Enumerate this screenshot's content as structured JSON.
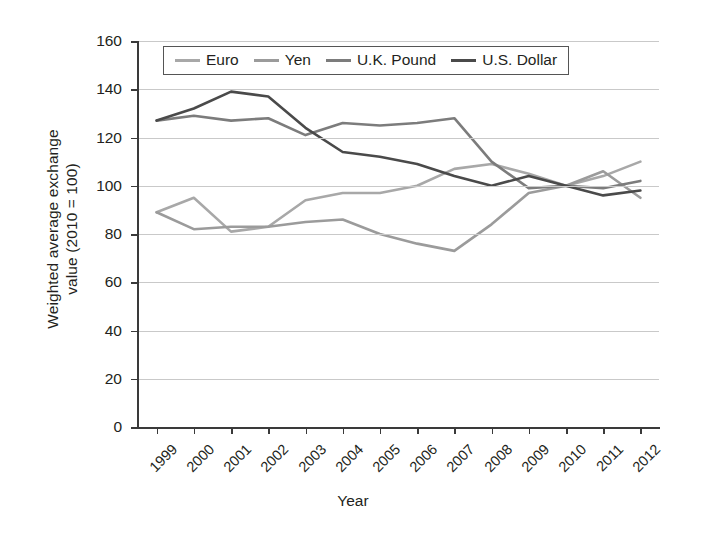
{
  "chart_data": {
    "type": "line",
    "title": "",
    "xlabel": "Year",
    "ylabel": "Weighted average exchange value (2010 = 100)",
    "ylabel_line1": "Weighted average exchange",
    "ylabel_line2": "value (2010 = 100)",
    "categories": [
      "1999",
      "2000",
      "2001",
      "2002",
      "2003",
      "2004",
      "2005",
      "2006",
      "2007",
      "2008",
      "2009",
      "2010",
      "2011",
      "2012"
    ],
    "x": [
      1999,
      2000,
      2001,
      2002,
      2003,
      2004,
      2005,
      2006,
      2007,
      2008,
      2009,
      2010,
      2011,
      2012
    ],
    "ylim": [
      0,
      160
    ],
    "yticks": [
      0,
      20,
      40,
      60,
      80,
      100,
      120,
      140,
      160
    ],
    "xlim_labels": [
      "1999",
      "2012"
    ],
    "grid": "horizontal",
    "legend_position": "top-inside",
    "series": [
      {
        "name": "Euro",
        "color": "#a8a8a8",
        "values": [
          89,
          95,
          81,
          83,
          94,
          97,
          97,
          100,
          107,
          109,
          105,
          100,
          104,
          110
        ]
      },
      {
        "name": "Yen",
        "color": "#9b9b9b",
        "values": [
          89,
          82,
          83,
          83,
          85,
          86,
          80,
          76,
          73,
          84,
          97,
          100,
          106,
          95
        ]
      },
      {
        "name": "U.K. Pound",
        "color": "#7c7c7c",
        "values": [
          127,
          129,
          127,
          128,
          121,
          126,
          125,
          126,
          128,
          110,
          99,
          100,
          99,
          102
        ]
      },
      {
        "name": "U.S. Dollar",
        "color": "#4a4a4a",
        "values": [
          127,
          132,
          139,
          137,
          124,
          114,
          112,
          109,
          104,
          100,
          104,
          100,
          96,
          98
        ]
      }
    ]
  },
  "legend": {
    "items": [
      {
        "label": "Euro"
      },
      {
        "label": "Yen"
      },
      {
        "label": "U.K. Pound"
      },
      {
        "label": "U.S. Dollar"
      }
    ]
  },
  "axes": {
    "y_ticks": [
      "160",
      "140",
      "120",
      "100",
      "80",
      "60",
      "40",
      "20",
      "0"
    ],
    "x_ticks": [
      "1999",
      "2000",
      "2001",
      "2002",
      "2003",
      "2004",
      "2005",
      "2006",
      "2007",
      "2008",
      "2009",
      "2010",
      "2011",
      "2012"
    ],
    "x_title": "Year",
    "y_title_line1": "Weighted average exchange",
    "y_title_line2": "value (2010 = 100)"
  }
}
